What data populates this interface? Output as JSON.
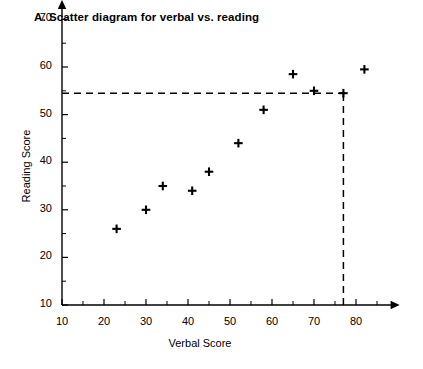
{
  "figure": {
    "title": "A. Scatter diagram for verbal vs. reading",
    "xlabel": "Verbal Score",
    "ylabel": "Reading Score"
  },
  "chart_data": {
    "type": "scatter",
    "title": "A. Scatter diagram for verbal vs. reading",
    "xlabel": "Verbal Score",
    "ylabel": "Reading Score",
    "xlim": [
      10,
      88
    ],
    "ylim": [
      10,
      72
    ],
    "xticks": [
      10,
      20,
      30,
      40,
      50,
      60,
      70,
      80
    ],
    "yticks": [
      10,
      20,
      30,
      40,
      50,
      60,
      70
    ],
    "xticks_minor": [
      15,
      25,
      35,
      45,
      55,
      65,
      75,
      85
    ],
    "yticks_minor": [
      15,
      25,
      35,
      45,
      55,
      65
    ],
    "grid": false,
    "legend": null,
    "marker": "plus",
    "marker_color": "#000000",
    "points": [
      {
        "x": 23,
        "y": 26
      },
      {
        "x": 30,
        "y": 30
      },
      {
        "x": 34,
        "y": 35
      },
      {
        "x": 41,
        "y": 34
      },
      {
        "x": 45,
        "y": 38
      },
      {
        "x": 52,
        "y": 44
      },
      {
        "x": 58,
        "y": 51
      },
      {
        "x": 65,
        "y": 58.5
      },
      {
        "x": 70,
        "y": 55
      },
      {
        "x": 77,
        "y": 54.5
      },
      {
        "x": 82,
        "y": 59.5
      }
    ],
    "annotations": [
      {
        "type": "dashed-guide",
        "name": "reading-guide-horizontal",
        "from": {
          "x": 10,
          "y": 54.5
        },
        "to": {
          "x": 77,
          "y": 54.5
        }
      },
      {
        "type": "dashed-guide",
        "name": "verbal-guide-vertical",
        "from": {
          "x": 77,
          "y": 10
        },
        "to": {
          "x": 77,
          "y": 54.5
        }
      }
    ]
  },
  "axes": {
    "x_tick_labels": [
      "10",
      "20",
      "30",
      "40",
      "50",
      "60",
      "70",
      "80"
    ],
    "y_tick_labels": [
      "10",
      "20",
      "30",
      "40",
      "50",
      "60",
      "70"
    ]
  }
}
